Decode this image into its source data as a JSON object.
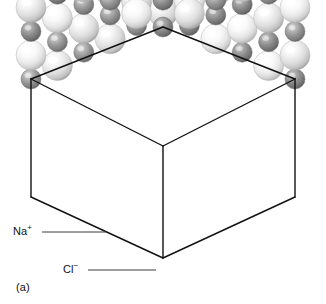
{
  "figure": {
    "caption": "(a)",
    "background_color": "#ffffff"
  },
  "labels": [
    {
      "id": "na",
      "symbol": "Na",
      "charge": "+",
      "full_text": "Na+",
      "ion_name": "sodium-ion",
      "sphere_color": "#8f8f8f",
      "leader_line": {
        "from_x": 42,
        "from_y": 232,
        "to_x": 106,
        "to_y": 232
      }
    },
    {
      "id": "cl",
      "symbol": "Cl",
      "charge": "−",
      "full_text": "Cl−",
      "ion_name": "chloride-ion",
      "sphere_color": "#f2f2f2",
      "leader_line": {
        "from_x": 88,
        "from_y": 270,
        "to_x": 156,
        "to_y": 270
      }
    }
  ],
  "cube": {
    "name": "unit-cell-outline",
    "stroke_color": "#111111",
    "stroke_width": 1.4,
    "vertices": {
      "top": [
        163,
        27
      ],
      "upper_left": [
        31,
        79
      ],
      "upper_right": [
        295,
        79
      ],
      "center": [
        163,
        146
      ],
      "lower_left": [
        31,
        197
      ],
      "lower_right": [
        295,
        197
      ],
      "bottom": [
        163,
        258
      ]
    }
  },
  "colors": {
    "sphere_light_base": "#fbfbfb",
    "sphere_light_mid": "#e2e2e2",
    "sphere_light_edge": "#b4b4b4",
    "sphere_dark_base": "#bdbdbd",
    "sphere_dark_mid": "#8e8e8e",
    "sphere_dark_edge": "#6a6a6a",
    "outline": "#111111",
    "leader": "#3a3a3a",
    "text": "#111111"
  },
  "chart_data": {
    "type": "scatter",
    "xlabel": "",
    "ylabel": "",
    "legend": [
      "Na+",
      "Cl-"
    ],
    "categories": [
      "Na+",
      "Cl-"
    ],
    "values": [
      1,
      1
    ]
  }
}
